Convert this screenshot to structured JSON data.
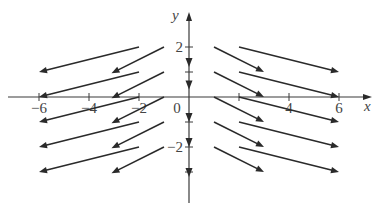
{
  "chart_data": {
    "type": "vector_field",
    "title": "",
    "xlabel": "x",
    "ylabel": "y",
    "xlim": [
      -7,
      7.3
    ],
    "ylim": [
      -4.3,
      3.4
    ],
    "grid": false,
    "legend": null,
    "x_ticks": [
      -6,
      -4,
      -2,
      0,
      2,
      4,
      6
    ],
    "x_tick_labels": [
      "−6",
      "−4",
      "−2",
      "0",
      "",
      "4",
      "6"
    ],
    "y_ticks": [
      -3,
      -2,
      -1,
      1,
      2
    ],
    "y_tick_labels": [
      "",
      "−2",
      "",
      "",
      "2"
    ],
    "origin_label": "0",
    "vectors": [
      {
        "x0": -2,
        "y0": 2,
        "x1": -6,
        "y1": 1
      },
      {
        "x0": -1,
        "y0": 2,
        "x1": -3.1,
        "y1": 0.95
      },
      {
        "x0": -2,
        "y0": 1,
        "x1": -6,
        "y1": 0
      },
      {
        "x0": -1,
        "y0": 1,
        "x1": -3.1,
        "y1": -0.05
      },
      {
        "x0": -2,
        "y0": 0,
        "x1": -6,
        "y1": -1
      },
      {
        "x0": -1,
        "y0": 0,
        "x1": -3.1,
        "y1": -1.05
      },
      {
        "x0": -2,
        "y0": -1,
        "x1": -6,
        "y1": -2
      },
      {
        "x0": -1,
        "y0": -1,
        "x1": -3.1,
        "y1": -2.05
      },
      {
        "x0": -2,
        "y0": -2,
        "x1": -6,
        "y1": -3
      },
      {
        "x0": -1,
        "y0": -2,
        "x1": -3.1,
        "y1": -3.05
      },
      {
        "x0": 1,
        "y0": 2,
        "x1": 3,
        "y1": 1
      },
      {
        "x0": 2,
        "y0": 2,
        "x1": 6,
        "y1": 1
      },
      {
        "x0": 1,
        "y0": 1,
        "x1": 3,
        "y1": 0
      },
      {
        "x0": 2,
        "y0": 1,
        "x1": 6,
        "y1": 0
      },
      {
        "x0": 1,
        "y0": 0,
        "x1": 3,
        "y1": -1
      },
      {
        "x0": 2,
        "y0": 0,
        "x1": 6,
        "y1": -1
      },
      {
        "x0": 1,
        "y0": -1,
        "x1": 3,
        "y1": -2
      },
      {
        "x0": 2,
        "y0": -1,
        "x1": 6,
        "y1": -2
      },
      {
        "x0": 1,
        "y0": -2,
        "x1": 3,
        "y1": -3
      },
      {
        "x0": 2,
        "y0": -2,
        "x1": 6,
        "y1": -3
      }
    ],
    "axis_arrowheads_on_y": [
      1.4,
      0.5,
      -0.8,
      -1.8,
      -3.0
    ]
  },
  "frame": {
    "origin_px": [
      189,
      97
    ],
    "unit_px": 25,
    "x_axis_range_px": [
      8,
      372
    ],
    "y_axis_range_px": [
      12,
      203
    ]
  },
  "colors": {
    "ink": "#2a2a2a",
    "axis": "#3a3a3a",
    "text": "#444444",
    "background": "#ffffff"
  }
}
